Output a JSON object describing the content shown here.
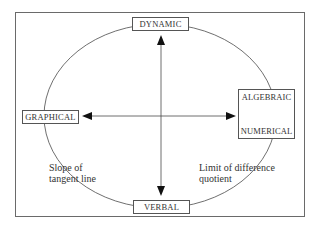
{
  "diagram": {
    "nodes": {
      "top": "DYNAMIC",
      "left": "GRAPHICAL",
      "right_top": "ALGEBRAIC",
      "right_bottom": "NUMERICAL",
      "bottom": "VERBAL"
    },
    "annotations": {
      "left_line1": "Slope of",
      "left_line2": "tangent line",
      "right_line1": "Limit of difference",
      "right_line2": "quotient"
    },
    "edges": [
      {
        "from": "DYNAMIC",
        "to": "VERBAL",
        "type": "bidirectional"
      },
      {
        "from": "GRAPHICAL",
        "to": "ALGEBRAIC/NUMERICAL",
        "type": "bidirectional"
      },
      {
        "from": "ALGEBRAIC",
        "to": "NUMERICAL",
        "type": "bidirectional"
      }
    ],
    "colors": {
      "line": "#4a4a4a",
      "background": "#ffffff"
    }
  }
}
